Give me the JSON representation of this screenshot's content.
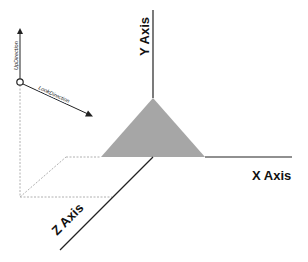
{
  "diagram": {
    "type": "3d-camera-coordinate-system",
    "axes": {
      "x": {
        "label": "X Axis"
      },
      "y": {
        "label": "Y Axis"
      },
      "z": {
        "label": "Z Axis"
      }
    },
    "camera": {
      "up_direction_label": "UpDirection",
      "look_direction_label": "LookDirection"
    },
    "shape": {
      "name": "triangle",
      "fill": "#a6a6a6"
    },
    "colors": {
      "axis": "#222222",
      "dotted_guide": "#b0b0b0",
      "triangle": "#a6a6a6"
    }
  }
}
